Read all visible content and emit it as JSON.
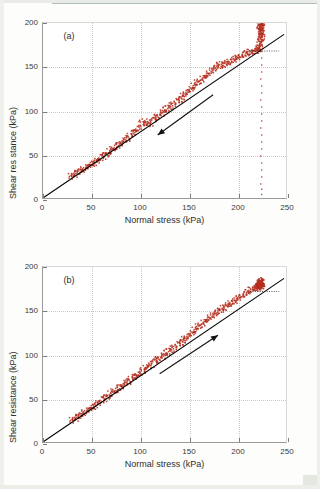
{
  "figure": {
    "colors": {
      "data_red": "#b5301f",
      "fit_line": "#000000",
      "axis": "#7d7d7d",
      "grid": "#c9c9c9",
      "text": "#2e2e2e"
    }
  },
  "chart_data": [
    {
      "type": "scatter",
      "panel_tag": "(a)",
      "title": "",
      "xlabel": "Normal stress (kPa)",
      "ylabel": "Shear res stance (kPa)",
      "xlim": [
        0,
        250
      ],
      "ylim": [
        0,
        200
      ],
      "xticks": [
        0,
        50,
        100,
        150,
        200,
        250
      ],
      "yticks": [
        0,
        50,
        100,
        150,
        200
      ],
      "grid": true,
      "legend": "none",
      "annotations": [
        {
          "name": "friction-angle",
          "text": "37°",
          "x": 232,
          "y": 176
        },
        {
          "name": "direction-arrow",
          "text": "",
          "direction": "down-left",
          "from": [
            175,
            118
          ],
          "to": [
            118,
            72
          ]
        }
      ],
      "fit_line": {
        "name": "failure-envelope",
        "slope": 0.7536,
        "intercept": 0,
        "from": [
          0,
          0
        ],
        "to": [
          248,
          187
        ]
      },
      "reference_line": {
        "name": "angle-dashed-baseline",
        "style": "dotted",
        "from": [
          213,
          168
        ],
        "to": [
          243,
          168
        ]
      },
      "series": [
        {
          "name": "shear-unload-trace",
          "comment": "main linear trace, unloading from peak back toward origin",
          "x": [
            30,
            33,
            36,
            39,
            42,
            45,
            48,
            51,
            54,
            57,
            60,
            63,
            66,
            69,
            72,
            75,
            78,
            81,
            84,
            87,
            90,
            93,
            96,
            99,
            102,
            105,
            108,
            111,
            114,
            117,
            120,
            123,
            126,
            129,
            132,
            135,
            138,
            141,
            144,
            147,
            150,
            153,
            156,
            159,
            162,
            165,
            168,
            171,
            174,
            177,
            180,
            183,
            186,
            189,
            192,
            195,
            198,
            201,
            204,
            207,
            210,
            213,
            216,
            219,
            222,
            224
          ],
          "y": [
            24,
            26,
            28,
            30,
            32,
            34,
            36,
            38,
            40,
            42,
            45,
            47,
            49,
            52,
            54,
            57,
            59,
            62,
            64,
            67,
            70,
            73,
            76,
            79,
            84,
            86,
            83,
            85,
            88,
            91,
            93,
            96,
            99,
            101,
            104,
            107,
            109,
            112,
            115,
            118,
            121,
            124,
            127,
            130,
            132,
            135,
            138,
            141,
            144,
            147,
            150,
            151,
            152,
            153,
            154,
            156,
            158,
            160,
            161,
            163,
            164,
            165,
            166,
            167,
            168,
            170
          ]
        },
        {
          "name": "shear-peak-spike",
          "comment": "near-vertical rise at the peak normal stress up to 200 kPa",
          "x": [
            223,
            224,
            225,
            224,
            226,
            225,
            224,
            226,
            225,
            224,
            225,
            226,
            225,
            224,
            225,
            226,
            224,
            225
          ],
          "y": [
            170,
            173,
            176,
            179,
            182,
            184,
            186,
            188,
            190,
            191,
            193,
            194,
            195,
            196,
            197,
            198,
            199,
            200
          ]
        },
        {
          "name": "shear-vertical-dropoff",
          "comment": "sparse column of points at constant normal stress dropping to zero",
          "x": [
            225,
            225,
            225,
            224,
            225,
            225,
            224,
            225,
            225,
            225,
            224,
            225,
            225,
            225,
            224,
            225,
            225,
            225,
            224,
            225,
            225
          ],
          "y": [
            160,
            152,
            144,
            136,
            128,
            120,
            112,
            104,
            96,
            88,
            80,
            72,
            64,
            56,
            48,
            40,
            32,
            24,
            16,
            10,
            4
          ]
        }
      ]
    },
    {
      "type": "scatter",
      "panel_tag": "(b)",
      "title": "",
      "xlabel": "Normal stress (kPa)",
      "ylabel": "Shear resistance (kPa)",
      "xlim": [
        0,
        250
      ],
      "ylim": [
        0,
        200
      ],
      "xticks": [
        0,
        50,
        100,
        150,
        200,
        250
      ],
      "yticks": [
        0,
        50,
        100,
        150,
        200
      ],
      "grid": true,
      "legend": "none",
      "annotations": [
        {
          "name": "friction-angle",
          "text": "37°",
          "x": 232,
          "y": 180
        },
        {
          "name": "direction-arrow",
          "text": "",
          "direction": "up-right",
          "from": [
            120,
            78
          ],
          "to": [
            180,
            122
          ]
        }
      ],
      "fit_line": {
        "name": "failure-envelope",
        "slope": 0.7536,
        "intercept": 0,
        "from": [
          0,
          0
        ],
        "to": [
          248,
          187
        ]
      },
      "reference_line": {
        "name": "angle-dashed-baseline",
        "style": "dotted",
        "from": [
          213,
          172
        ],
        "to": [
          243,
          172
        ]
      },
      "series": [
        {
          "name": "shear-load-trace",
          "comment": "main linear trace, loading from origin up to peak",
          "x": [
            31,
            34,
            37,
            40,
            43,
            46,
            49,
            52,
            55,
            58,
            61,
            64,
            67,
            70,
            73,
            76,
            79,
            82,
            85,
            88,
            91,
            94,
            97,
            100,
            103,
            106,
            109,
            112,
            115,
            118,
            121,
            124,
            127,
            130,
            133,
            136,
            139,
            142,
            145,
            148,
            151,
            154,
            157,
            160,
            163,
            166,
            169,
            172,
            175,
            178,
            181,
            184,
            187,
            190,
            193,
            196,
            199,
            202,
            205,
            208,
            211,
            214,
            217,
            220,
            223
          ],
          "y": [
            24,
            26,
            28,
            30,
            33,
            35,
            37,
            39,
            42,
            44,
            47,
            49,
            51,
            54,
            56,
            58,
            61,
            63,
            66,
            68,
            71,
            73,
            75,
            77,
            80,
            83,
            85,
            88,
            91,
            93,
            95,
            97,
            100,
            102,
            105,
            108,
            110,
            113,
            116,
            118,
            121,
            124,
            127,
            130,
            132,
            135,
            138,
            141,
            143,
            146,
            148,
            151,
            153,
            155,
            157,
            159,
            161,
            164,
            166,
            168,
            170,
            172,
            174,
            176,
            178
          ]
        },
        {
          "name": "shear-peak-cluster",
          "comment": "compact dense blob of points at the peak",
          "x": [
            221,
            222,
            223,
            224,
            225,
            226,
            222,
            223,
            224,
            225,
            226,
            223,
            224,
            225,
            222,
            224,
            226,
            223,
            225
          ],
          "y": [
            175,
            176,
            177,
            177,
            178,
            178,
            179,
            179,
            180,
            180,
            181,
            181,
            182,
            182,
            176,
            183,
            177,
            178,
            180
          ]
        }
      ]
    }
  ]
}
